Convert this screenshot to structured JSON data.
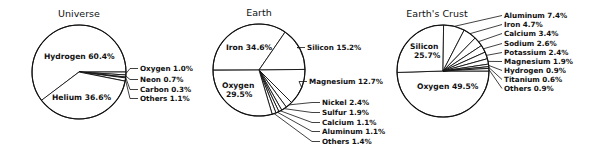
{
  "chart_data": [
    {
      "type": "pie",
      "title": "Universe",
      "center": [
        79,
        72
      ],
      "radius": 47,
      "start_angle": 142.6,
      "slices": [
        {
          "label": "Hydrogen",
          "value": 60.4,
          "text": "Hydrogen 60.4%",
          "placement": "inside",
          "pos": [
            44,
            59
          ]
        },
        {
          "label": "Oxygen",
          "value": 1.0,
          "text": "Oxygen 1.0%",
          "placement": "outside",
          "pos": [
            140,
            71
          ]
        },
        {
          "label": "Neon",
          "value": 0.7,
          "text": "Neon 0.7%",
          "placement": "outside",
          "pos": [
            140,
            82
          ]
        },
        {
          "label": "Carbon",
          "value": 0.3,
          "text": "Carbon 0.3%",
          "placement": "outside",
          "pos": [
            140,
            92
          ]
        },
        {
          "label": "Others",
          "value": 1.1,
          "text": "Others 1.1%",
          "placement": "outside",
          "pos": [
            140,
            101
          ]
        },
        {
          "label": "Helium",
          "value": 36.6,
          "text": "Helium 36.6%",
          "placement": "inside",
          "pos": [
            52,
            100
          ]
        }
      ]
    },
    {
      "type": "pie",
      "title": "Earth",
      "center": [
        259,
        70
      ],
      "radius": 46,
      "start_angle": 180,
      "slices": [
        {
          "label": "Iron",
          "value": 34.6,
          "text": "Iron 34.6%",
          "placement": "inside",
          "pos": [
            226,
            50
          ]
        },
        {
          "label": "Silicon",
          "value": 15.2,
          "text": "Silicon 15.2%",
          "placement": "outside",
          "pos": [
            307,
            50
          ]
        },
        {
          "label": "Magnesium",
          "value": 12.7,
          "text": "Magnesium 12.7%",
          "placement": "outside",
          "pos": [
            309,
            84
          ]
        },
        {
          "label": "Nickel",
          "value": 2.4,
          "text": "Nickel 2.4%",
          "placement": "outside",
          "pos": [
            322,
            105
          ]
        },
        {
          "label": "Sulfur",
          "value": 1.9,
          "text": "Sulfur 1.9%",
          "placement": "outside",
          "pos": [
            322,
            115
          ]
        },
        {
          "label": "Calcium",
          "value": 1.1,
          "text": "Calcium 1.1%",
          "placement": "outside",
          "pos": [
            322,
            125
          ]
        },
        {
          "label": "Aluminum",
          "value": 1.1,
          "text": "Aluminum 1.1%",
          "placement": "outside",
          "pos": [
            322,
            134
          ]
        },
        {
          "label": "Others",
          "value": 1.4,
          "text": "Others 1.4%",
          "placement": "outside",
          "pos": [
            322,
            144
          ]
        },
        {
          "label": "Oxygen",
          "value": 29.5,
          "text": "Oxygen\n29.5%",
          "placement": "inside",
          "pos": [
            222,
            88
          ]
        }
      ]
    },
    {
      "type": "pie",
      "title": "Earth's Crust",
      "center": [
        443,
        71
      ],
      "radius": 46,
      "start_angle": 0,
      "slices": [
        {
          "label": "Oxygen",
          "value": 49.5,
          "text": "Oxygen 49.5%",
          "placement": "inside",
          "pos": [
            417,
            89
          ]
        },
        {
          "label": "Silicon",
          "value": 25.7,
          "text": "Silicon\n25.7%",
          "placement": "inside",
          "pos": [
            410,
            49
          ]
        },
        {
          "label": "Aluminum",
          "value": 7.4,
          "text": "Aluminum 7.4%",
          "placement": "outside",
          "pos": [
            504,
            18
          ]
        },
        {
          "label": "Iron",
          "value": 4.7,
          "text": "Iron 4.7%",
          "placement": "outside",
          "pos": [
            504,
            27
          ]
        },
        {
          "label": "Calcium",
          "value": 3.4,
          "text": "Calcium 3.4%",
          "placement": "outside",
          "pos": [
            504,
            36
          ]
        },
        {
          "label": "Sodium",
          "value": 2.6,
          "text": "Sodium 2.6%",
          "placement": "outside",
          "pos": [
            504,
            46
          ]
        },
        {
          "label": "Potassium",
          "value": 2.4,
          "text": "Potassium 2.4%",
          "placement": "outside",
          "pos": [
            504,
            55
          ]
        },
        {
          "label": "Magnesium",
          "value": 1.9,
          "text": "Magnesium 1.9%",
          "placement": "outside",
          "pos": [
            504,
            64
          ]
        },
        {
          "label": "Hydrogen",
          "value": 0.9,
          "text": "Hydrogen 0.9%",
          "placement": "outside",
          "pos": [
            504,
            73
          ]
        },
        {
          "label": "Titanium",
          "value": 0.6,
          "text": "Titanium 0.6%",
          "placement": "outside",
          "pos": [
            504,
            82
          ]
        },
        {
          "label": "Others",
          "value": 0.9,
          "text": "Others 0.9%",
          "placement": "outside",
          "pos": [
            504,
            91
          ]
        }
      ]
    }
  ],
  "titles": {
    "universe": "Universe",
    "earth": "Earth",
    "crust": "Earth's Crust"
  },
  "colors": {
    "line": "#111111",
    "fill": "#ffffff",
    "text": "#111111"
  }
}
